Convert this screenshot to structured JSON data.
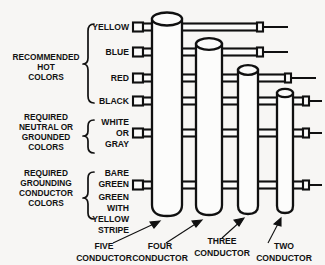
{
  "diagram": {
    "background_color": "#f7f6f4",
    "ink_color": "#101010",
    "categories": [
      {
        "id": "hot",
        "lines": [
          "RECOMMENDED",
          "HOT",
          "COLORS"
        ]
      },
      {
        "id": "neutral",
        "lines": [
          "REQUIRED",
          "NEUTRAL OR",
          "GROUNDED",
          "COLORS"
        ]
      },
      {
        "id": "grounding",
        "lines": [
          "REQUIRED",
          "GROUNDING",
          "CONDUCTOR",
          "COLORS"
        ]
      }
    ],
    "color_rows": [
      {
        "id": "yellow",
        "lines": [
          "YELLOW"
        ],
        "group": "hot"
      },
      {
        "id": "blue",
        "lines": [
          "BLUE"
        ],
        "group": "hot"
      },
      {
        "id": "red",
        "lines": [
          "RED"
        ],
        "group": "hot"
      },
      {
        "id": "black",
        "lines": [
          "BLACK"
        ],
        "group": "hot"
      },
      {
        "id": "white-or-gray",
        "lines": [
          "WHITE",
          "OR",
          "GRAY"
        ],
        "group": "neutral"
      },
      {
        "id": "bare-green",
        "lines": [
          "BARE",
          "GREEN"
        ],
        "group": "grounding"
      },
      {
        "id": "green-with-yellow-stripe",
        "lines": [
          "GREEN",
          "WITH",
          "YELLOW",
          "STRIPE"
        ],
        "group": "grounding"
      }
    ],
    "cables": [
      {
        "id": "five-conductor",
        "lines": [
          "FIVE",
          "CONDUCTOR"
        ],
        "conductors": 5
      },
      {
        "id": "four-conductor",
        "lines": [
          "FOUR",
          "CONDUCTOR"
        ],
        "conductors": 4
      },
      {
        "id": "three-conductor",
        "lines": [
          "THREE",
          "CONDUCTOR"
        ],
        "conductors": 3
      },
      {
        "id": "two-conductor",
        "lines": [
          "TWO",
          "CONDUCTOR"
        ],
        "conductors": 2
      }
    ],
    "labels": {
      "cat_hot_l1": "RECOMMENDED",
      "cat_hot_l2": "HOT",
      "cat_hot_l3": "COLORS",
      "cat_neutral_l1": "REQUIRED",
      "cat_neutral_l2": "NEUTRAL OR",
      "cat_neutral_l3": "GROUNDED",
      "cat_neutral_l4": "COLORS",
      "cat_ground_l1": "REQUIRED",
      "cat_ground_l2": "GROUNDING",
      "cat_ground_l3": "CONDUCTOR",
      "cat_ground_l4": "COLORS",
      "row_yellow": "YELLOW",
      "row_blue": "BLUE",
      "row_red": "RED",
      "row_black": "BLACK",
      "row_white": "WHITE",
      "row_or": "OR",
      "row_gray": "GRAY",
      "row_bare": "BARE",
      "row_green1": "GREEN",
      "row_green2": "GREEN",
      "row_with": "WITH",
      "row_yellow2": "YELLOW",
      "row_stripe": "STRIPE",
      "cable_five_l1": "FIVE",
      "cable_five_l2": "CONDUCTOR",
      "cable_four_l1": "FOUR",
      "cable_four_l2": "CONDUCTOR",
      "cable_three_l1": "THREE",
      "cable_three_l2": "CONDUCTOR",
      "cable_two_l1": "TWO",
      "cable_two_l2": "CONDUCTOR"
    }
  }
}
